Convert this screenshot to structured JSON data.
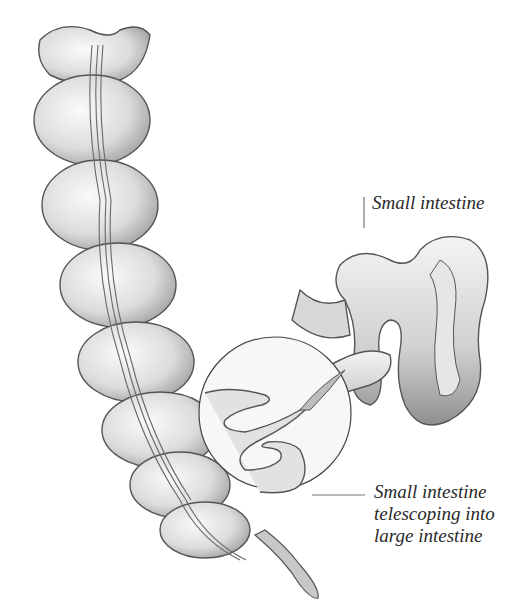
{
  "diagram": {
    "labels": {
      "small_intestine": "Small intestine",
      "telescoping": [
        "Small intestine",
        "telescoping into",
        "large intestine"
      ]
    },
    "colors": {
      "background": "#ffffff",
      "tissue_light": "#eeeeee",
      "tissue_mid": "#c8c8c8",
      "tissue_dark": "#8a8a8a",
      "outline": "#555555",
      "leader_line": "#777777",
      "text": "#2a2a2a"
    }
  }
}
